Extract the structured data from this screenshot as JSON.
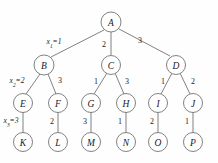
{
  "figure": {
    "background_color": "#fefefe",
    "stroke_color": "#6b6b6b",
    "text_color": "#1a1a1a",
    "width": 218,
    "height": 163
  },
  "nodes": [
    {
      "id": "A",
      "label": "A",
      "cx": 111,
      "cy": 22,
      "r": 10,
      "level": 1
    },
    {
      "id": "B",
      "label": "B",
      "cx": 44,
      "cy": 65,
      "r": 10,
      "level": 2
    },
    {
      "id": "C",
      "label": "C",
      "cx": 111,
      "cy": 65,
      "r": 9.5,
      "level": 2
    },
    {
      "id": "D",
      "label": "D",
      "cx": 176,
      "cy": 65,
      "r": 9.5,
      "level": 2
    },
    {
      "id": "E",
      "label": "E",
      "cx": 23,
      "cy": 103,
      "r": 9.5,
      "level": 3
    },
    {
      "id": "F",
      "label": "F",
      "cx": 58,
      "cy": 103,
      "r": 9.5,
      "level": 3
    },
    {
      "id": "G",
      "label": "G",
      "cx": 91,
      "cy": 103,
      "r": 9.5,
      "level": 3
    },
    {
      "id": "H",
      "label": "H",
      "cx": 126,
      "cy": 103,
      "r": 9.5,
      "level": 3
    },
    {
      "id": "I",
      "label": "I",
      "cx": 158,
      "cy": 103,
      "r": 9.5,
      "level": 3
    },
    {
      "id": "J",
      "label": "J",
      "cx": 193,
      "cy": 103,
      "r": 9.5,
      "level": 3
    },
    {
      "id": "K",
      "label": "K",
      "cx": 23,
      "cy": 142,
      "r": 9.5,
      "level": 4
    },
    {
      "id": "L",
      "label": "L",
      "cx": 58,
      "cy": 142,
      "r": 9.5,
      "level": 4
    },
    {
      "id": "M",
      "label": "M",
      "cx": 91,
      "cy": 142,
      "r": 9.5,
      "level": 4
    },
    {
      "id": "N",
      "label": "N",
      "cx": 126,
      "cy": 142,
      "r": 9.5,
      "level": 4
    },
    {
      "id": "O",
      "label": "O",
      "cx": 158,
      "cy": 142,
      "r": 9.5,
      "level": 4
    },
    {
      "id": "P",
      "label": "P",
      "cx": 193,
      "cy": 142,
      "r": 9.5,
      "level": 4
    }
  ],
  "edges": [
    {
      "id": "A-B",
      "from": "A",
      "to": "B",
      "x1": 104,
      "y1": 30,
      "x2": 51,
      "y2": 57,
      "label": "x1=1",
      "label_kind": "variable",
      "var": "x",
      "sub": "1",
      "value": "1",
      "lx": 54,
      "ly": 41
    },
    {
      "id": "A-C",
      "from": "A",
      "to": "C",
      "x1": 111,
      "y1": 32,
      "x2": 111,
      "y2": 55,
      "label": "2",
      "label_kind": "plain",
      "value": "2",
      "lx": 104,
      "ly": 44
    },
    {
      "id": "A-D",
      "from": "A",
      "to": "D",
      "x1": 119,
      "y1": 29,
      "x2": 170,
      "y2": 56,
      "label": "3",
      "label_kind": "plain",
      "value": "3",
      "lx": 140,
      "ly": 40
    },
    {
      "id": "B-E",
      "from": "B",
      "to": "E",
      "x1": 40,
      "y1": 74,
      "x2": 26,
      "y2": 94,
      "label": "x2=2",
      "label_kind": "variable",
      "var": "x",
      "sub": "2",
      "value": "2",
      "lx": 17,
      "ly": 80
    },
    {
      "id": "B-F",
      "from": "B",
      "to": "F",
      "x1": 48,
      "y1": 74,
      "x2": 56,
      "y2": 94,
      "label": "3",
      "label_kind": "plain",
      "value": "3",
      "lx": 60,
      "ly": 80
    },
    {
      "id": "C-G",
      "from": "C",
      "to": "G",
      "x1": 107,
      "y1": 73,
      "x2": 94,
      "y2": 94,
      "label": "1",
      "label_kind": "plain",
      "value": "1",
      "lx": 96,
      "ly": 81
    },
    {
      "id": "C-H",
      "from": "C",
      "to": "H",
      "x1": 115,
      "y1": 73,
      "x2": 124,
      "y2": 94,
      "label": "3",
      "label_kind": "plain",
      "value": "3",
      "lx": 127,
      "ly": 81
    },
    {
      "id": "D-I",
      "from": "D",
      "to": "I",
      "x1": 172,
      "y1": 73,
      "x2": 161,
      "y2": 94,
      "label": "1",
      "label_kind": "plain",
      "value": "1",
      "lx": 163,
      "ly": 81
    },
    {
      "id": "D-J",
      "from": "D",
      "to": "J",
      "x1": 180,
      "y1": 73,
      "x2": 190,
      "y2": 94,
      "label": "2",
      "label_kind": "plain",
      "value": "2",
      "lx": 193,
      "ly": 81
    },
    {
      "id": "E-K",
      "from": "E",
      "to": "K",
      "x1": 23,
      "y1": 112,
      "x2": 23,
      "y2": 133,
      "label": "x3=3",
      "label_kind": "variable",
      "var": "x",
      "sub": "3",
      "value": "3",
      "lx": 11,
      "ly": 120
    },
    {
      "id": "F-L",
      "from": "F",
      "to": "L",
      "x1": 58,
      "y1": 112,
      "x2": 58,
      "y2": 133,
      "label": "2",
      "label_kind": "plain",
      "value": "2",
      "lx": 52,
      "ly": 121
    },
    {
      "id": "G-M",
      "from": "G",
      "to": "M",
      "x1": 91,
      "y1": 112,
      "x2": 91,
      "y2": 133,
      "label": "3",
      "label_kind": "plain",
      "value": "3",
      "lx": 85,
      "ly": 121
    },
    {
      "id": "H-N",
      "from": "H",
      "to": "N",
      "x1": 126,
      "y1": 112,
      "x2": 126,
      "y2": 133,
      "label": "1",
      "label_kind": "plain",
      "value": "1",
      "lx": 120,
      "ly": 121
    },
    {
      "id": "I-O",
      "from": "I",
      "to": "O",
      "x1": 158,
      "y1": 112,
      "x2": 158,
      "y2": 133,
      "label": "2",
      "label_kind": "plain",
      "value": "2",
      "lx": 152,
      "ly": 121
    },
    {
      "id": "J-P",
      "from": "J",
      "to": "P",
      "x1": 193,
      "y1": 112,
      "x2": 193,
      "y2": 133,
      "label": "1",
      "label_kind": "plain",
      "value": "1",
      "lx": 187,
      "ly": 121
    }
  ],
  "chart_data": {
    "type": "diagram",
    "subtype": "tree",
    "title": "",
    "node_labels": [
      "A",
      "B",
      "C",
      "D",
      "E",
      "F",
      "G",
      "H",
      "I",
      "J",
      "K",
      "L",
      "M",
      "N",
      "O",
      "P"
    ],
    "edge_list": [
      [
        "A",
        "B",
        "x1=1"
      ],
      [
        "A",
        "C",
        "2"
      ],
      [
        "A",
        "D",
        "3"
      ],
      [
        "B",
        "E",
        "x2=2"
      ],
      [
        "B",
        "F",
        "3"
      ],
      [
        "C",
        "G",
        "1"
      ],
      [
        "C",
        "H",
        "3"
      ],
      [
        "D",
        "I",
        "1"
      ],
      [
        "D",
        "J",
        "2"
      ],
      [
        "E",
        "K",
        "x3=3"
      ],
      [
        "F",
        "L",
        "2"
      ],
      [
        "G",
        "M",
        "3"
      ],
      [
        "H",
        "N",
        "1"
      ],
      [
        "I",
        "O",
        "2"
      ],
      [
        "J",
        "P",
        "1"
      ]
    ],
    "levels": 4,
    "root": "A"
  }
}
